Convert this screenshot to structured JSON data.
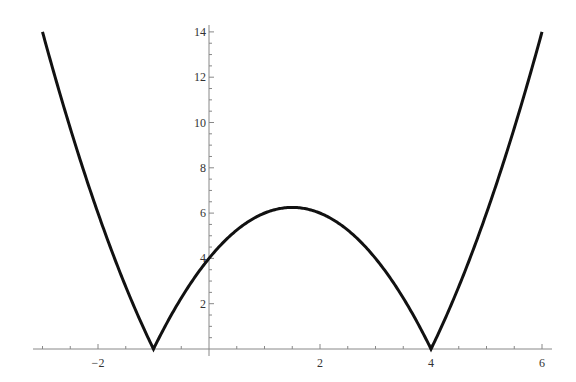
{
  "chart_data": {
    "type": "line",
    "title": "",
    "xlabel": "",
    "ylabel": "",
    "function": "|x^2 - 3x - 4|",
    "xlim": [
      -3.2,
      6.2
    ],
    "ylim": [
      0,
      14.3
    ],
    "grid": false,
    "legend": null,
    "x_ticks": [
      {
        "value": -2,
        "label": "−2"
      },
      {
        "value": 2,
        "label": "2"
      },
      {
        "value": 4,
        "label": "4"
      },
      {
        "value": 6,
        "label": "6"
      }
    ],
    "y_ticks": [
      {
        "value": 2,
        "label": "2"
      },
      {
        "value": 4,
        "label": "4"
      },
      {
        "value": 6,
        "label": "6"
      },
      {
        "value": 8,
        "label": "8"
      },
      {
        "value": 10,
        "label": "10"
      },
      {
        "value": 12,
        "label": "12"
      },
      {
        "value": 14,
        "label": "14"
      }
    ],
    "series": [
      {
        "name": "y = |x^2 - 3x - 4|",
        "color": "#111111",
        "x": [
          -3,
          -2.5,
          -2,
          -1.5,
          -1,
          -0.5,
          0,
          0.5,
          1,
          1.5,
          2,
          2.5,
          3,
          3.5,
          4,
          4.5,
          5,
          5.5,
          6
        ],
        "y": [
          14,
          9.75,
          6,
          2.75,
          0,
          2.25,
          4,
          5.25,
          6,
          6.25,
          6,
          5.25,
          4,
          2.25,
          0,
          2.75,
          6,
          9.75,
          14
        ]
      }
    ],
    "annotations": {
      "zeros": [
        -1,
        4
      ],
      "vertex": [
        1.5,
        6.25
      ]
    }
  }
}
